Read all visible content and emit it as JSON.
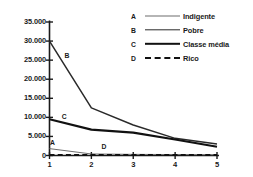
{
  "chart_data": {
    "type": "line",
    "title": "",
    "xlabel": "",
    "ylabel": "",
    "x": [
      1,
      2,
      3,
      4,
      5
    ],
    "xticklabels": [
      "1",
      "2",
      "3",
      "4",
      "5"
    ],
    "yticklabels": [
      "35.000",
      "30.000",
      "25.000",
      "20.000",
      "15.000",
      "10.000",
      "5.000",
      "0"
    ],
    "ytickvalues": [
      35000,
      30000,
      25000,
      20000,
      15000,
      10000,
      5000,
      0
    ],
    "xlim": [
      1,
      5
    ],
    "ylim": [
      0,
      35000
    ],
    "grid": false,
    "legend_position": "top-right",
    "series": [
      {
        "key": "A",
        "name": "Indigente",
        "values": [
          1800,
          400,
          300,
          250,
          200
        ],
        "color": "#6d6d6d",
        "style": "solid",
        "width": 1,
        "label_x": 1.07,
        "label_y": 4200
      },
      {
        "key": "B",
        "name": "Pobre",
        "values": [
          30000,
          12500,
          8000,
          4500,
          3000
        ],
        "color": "#2a2a2a",
        "style": "solid",
        "width": 1.5,
        "label_x": 1.42,
        "label_y": 27200
      },
      {
        "key": "C",
        "name": "Classe média",
        "values": [
          9500,
          6800,
          6000,
          4200,
          2300
        ],
        "color": "#111111",
        "style": "solid",
        "width": 2.2,
        "label_x": 1.35,
        "label_y": 11200
      },
      {
        "key": "D",
        "name": "Rico",
        "values": [
          150,
          150,
          120,
          110,
          100
        ],
        "color": "#111111",
        "style": "dashed",
        "width": 2,
        "label_x": 2.3,
        "label_y": 3400
      }
    ]
  },
  "legend": {
    "rows": [
      {
        "key": "A",
        "label": "Indigente"
      },
      {
        "key": "B",
        "label": "Pobre"
      },
      {
        "key": "C",
        "label": "Classe média"
      },
      {
        "key": "D",
        "label": "Rico"
      }
    ]
  },
  "axes": {
    "axis_color": "#1a1a1a"
  }
}
